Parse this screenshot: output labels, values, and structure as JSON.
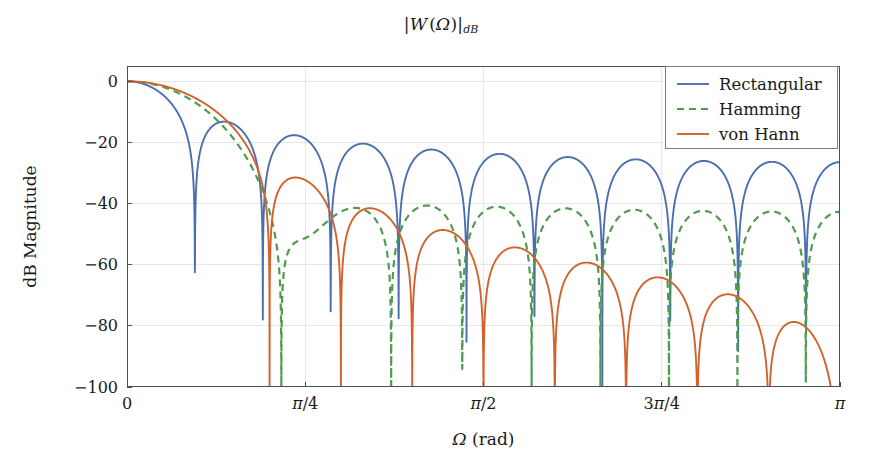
{
  "figure": {
    "title_parts": {
      "open_bar": "|",
      "w": "W",
      "paren_open": "(",
      "omega": "Ω",
      "paren_close": ")",
      "close_bar": "|",
      "subscript": "dB"
    },
    "title_plain": "|W (Ω)|dB",
    "width_px": 882,
    "height_px": 475,
    "background": "#ffffff",
    "frame_color": "#4d4d4d",
    "grid_color": "#e6e6e6"
  },
  "plot_area": {
    "left": 127,
    "top": 66,
    "right": 840,
    "bottom": 387
  },
  "legend": {
    "position": "top-right-inside",
    "box": {
      "x": 665,
      "y": 66,
      "width": 172,
      "height": 82
    },
    "entries": [
      {
        "label": "Rectangular",
        "color": "#4a6fb0",
        "dash": "none"
      },
      {
        "label": "Hamming",
        "color": "#4f9b4f",
        "dash": "dashed"
      },
      {
        "label": "von Hann",
        "color": "#d1622c",
        "dash": "none"
      }
    ]
  },
  "chart_data": {
    "type": "line",
    "xlabel": "Ω (rad)",
    "ylabel": "dB Magnitude",
    "xlim": [
      0,
      3.141592653589793
    ],
    "ylim": [
      -100,
      5
    ],
    "grid": true,
    "legend_position": "upper right",
    "x_ticks": [
      {
        "value": 0.0,
        "label": "0"
      },
      {
        "value": 0.7853981633974483,
        "label": "π/4"
      },
      {
        "value": 1.5707963267948966,
        "label": "π/2"
      },
      {
        "value": 2.356194490192345,
        "label": "3π/4"
      },
      {
        "value": 3.141592653589793,
        "label": "π"
      }
    ],
    "y_ticks": [
      {
        "value": 0,
        "label": "0"
      },
      {
        "value": -20,
        "label": "−20"
      },
      {
        "value": -40,
        "label": "−40"
      },
      {
        "value": -60,
        "label": "−60"
      },
      {
        "value": -80,
        "label": "−80"
      },
      {
        "value": -100,
        "label": "−100"
      }
    ],
    "window_length": 21,
    "normalization": "peak at 0 dB",
    "series": [
      {
        "name": "Rectangular",
        "color": "#4a6fb0",
        "dash": "none",
        "width": 1.9,
        "window": "rectangular",
        "main_lobe_null_rad": 0.299,
        "peak_sidelobe_db": -13.3,
        "sidelobe_peaks_db": [
          -17.5,
          -20.5,
          -22.0,
          -23.3,
          -24.3,
          -25.0,
          -25.6,
          -26.1,
          -26.5,
          -26.8,
          -27.0
        ],
        "value_at_pi_db": -26.8
      },
      {
        "name": "Hamming",
        "color": "#4f9b4f",
        "dash": "dashed",
        "width": 2.2,
        "window": "hamming",
        "main_lobe_null_rad": 0.598,
        "peak_sidelobe_db": -41.5,
        "sidelobe_peaks_db": [
          -53.0,
          -41.3,
          -42.2,
          -41.0,
          -41.8,
          -42.3,
          -41.9,
          -42.5,
          -42.8,
          -43.0
        ],
        "value_at_pi_db": -43.0
      },
      {
        "name": "von Hann",
        "color": "#d1622c",
        "dash": "none",
        "width": 1.9,
        "window": "hann",
        "main_lobe_null_rad": 0.598,
        "peak_sidelobe_db": -31.5,
        "sidelobe_peaks_db": [
          -31.5,
          -41.5,
          -48.5,
          -54.0,
          -58.5,
          -62.5,
          -66.0,
          -70.5,
          -75.5,
          -84.0
        ],
        "value_at_pi_db": -100
      }
    ]
  }
}
